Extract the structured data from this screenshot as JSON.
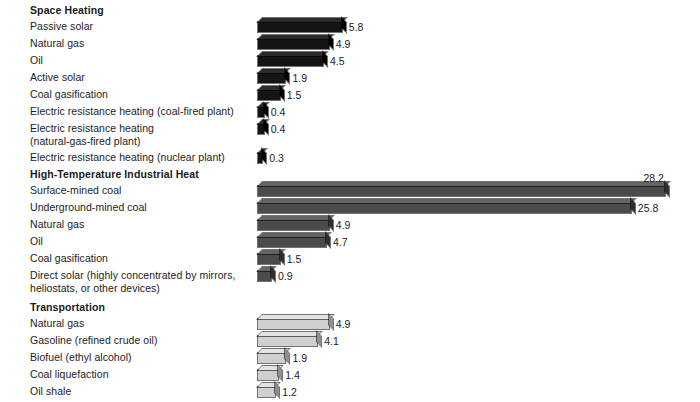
{
  "chart_data": {
    "type": "bar",
    "orientation": "horizontal",
    "title": "",
    "xlabel": "",
    "ylabel": "",
    "grid": false,
    "legend": "none",
    "value_label_precision": 1,
    "xlim": [
      0,
      28.2
    ],
    "groups": [
      {
        "name": "Space Heating",
        "fill": "#141414",
        "palette": "pal-dark",
        "categories": [
          "Passive solar",
          "Natural gas",
          "Oil",
          "Active solar",
          "Coal gasification",
          "Electric resistance heating (coal-fired plant)",
          "Electric resistance heating\n(natural-gas-fired plant)",
          "Electric resistance heating (nuclear plant)"
        ],
        "values": [
          5.8,
          4.9,
          4.5,
          1.9,
          1.5,
          0.4,
          0.4,
          0.3
        ],
        "value_labels": [
          "5.8",
          "4.9",
          "4.5",
          "1.9",
          "1.5",
          "0.4",
          "0.4",
          "0.3"
        ]
      },
      {
        "name": "High-Temperature Industrial Heat",
        "fill": "#4b4b4b",
        "palette": "pal-mid",
        "categories": [
          "Surface-mined coal",
          "Underground-mined coal",
          "Natural gas",
          "Oil",
          "Coal gasification",
          "Direct solar (highly concentrated by mirrors,\nheliostats, or other devices)"
        ],
        "values": [
          28.2,
          25.8,
          4.9,
          4.7,
          1.5,
          0.9
        ],
        "value_labels": [
          "28.2",
          "25.8",
          "4.9",
          "4.7",
          "1.5",
          "0.9"
        ]
      },
      {
        "name": "Transportation",
        "fill": "#cfcfcf",
        "palette": "pal-light",
        "categories": [
          "Natural gas",
          "Gasoline (refined crude oil)",
          "Biofuel (ethyl alcohol)",
          "Coal liquefaction",
          "Oil shale"
        ],
        "values": [
          4.9,
          4.1,
          1.9,
          1.4,
          1.2
        ],
        "value_labels": [
          "4.9",
          "4.1",
          "1.9",
          "1.4",
          "1.2"
        ]
      }
    ]
  },
  "layout": {
    "bar_origin_x": 258,
    "px_per_unit": 14.45,
    "row_height": 17,
    "bar_thickness": 10,
    "depth": 4
  }
}
